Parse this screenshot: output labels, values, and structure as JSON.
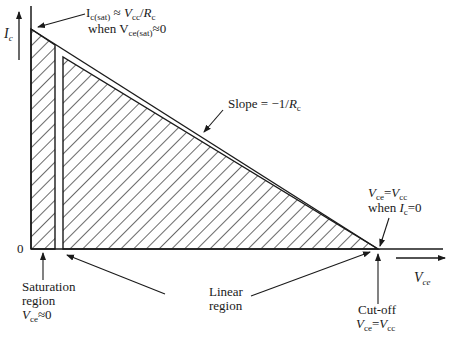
{
  "diagram": {
    "axes": {
      "y_label": "I",
      "y_label_sub": "c",
      "x_label": "V",
      "x_label_sub": "ce",
      "origin_label": "0"
    },
    "annotations": {
      "top": {
        "line1_a": "I",
        "line1_a_sub": "c(sat)",
        "line1_b": " ≈ ",
        "line1_c": "V",
        "line1_c_sub": "cc",
        "line1_d": "/",
        "line1_e": "R",
        "line1_e_sub": "c",
        "line2_a": "when V",
        "line2_a_sub": "ce(sat)",
        "line2_b": "≈0"
      },
      "slope": {
        "text_a": "Slope = −1/",
        "text_b": "R",
        "text_b_sub": "c"
      },
      "right": {
        "line1_a": "V",
        "line1_a_sub": "ce",
        "line1_b": "=",
        "line1_c": "V",
        "line1_c_sub": "cc",
        "line2_a": "when ",
        "line2_b": "I",
        "line2_b_sub": "c",
        "line2_c": "=0"
      },
      "saturation": {
        "line1": "Saturation",
        "line2": "region",
        "line3_a": "V",
        "line3_a_sub": "ce",
        "line3_b": "≈0"
      },
      "linear": {
        "line1": "Linear",
        "line2": "region"
      },
      "cutoff": {
        "line1": "Cut-off",
        "line2_a": "V",
        "line2_a_sub": "ce",
        "line2_b": "=",
        "line2_c": "V",
        "line2_c_sub": "cc"
      }
    },
    "colors": {
      "ink": "#1a1a1a",
      "background": "#ffffff"
    }
  }
}
